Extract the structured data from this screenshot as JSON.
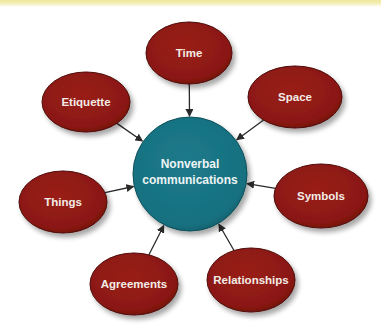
{
  "diagram": {
    "title": "Nonverbal communications",
    "center": {
      "line1": "Nonverbal",
      "line2": "communications",
      "color": "#1a7585",
      "cx": 190,
      "cy": 174,
      "r": 57
    },
    "node_color": "#8e1a14",
    "arrow_color": "#2a2a2a",
    "nodes": [
      {
        "label": "Time",
        "cx": 189,
        "cy": 53,
        "rx": 43,
        "ry": 31
      },
      {
        "label": "Space",
        "cx": 295,
        "cy": 97,
        "rx": 47,
        "ry": 31
      },
      {
        "label": "Etiquette",
        "cx": 86,
        "cy": 102,
        "rx": 44,
        "ry": 30
      },
      {
        "label": "Things",
        "cx": 63,
        "cy": 202,
        "rx": 44,
        "ry": 31
      },
      {
        "label": "Symbols",
        "cx": 321,
        "cy": 196,
        "rx": 47,
        "ry": 32
      },
      {
        "label": "Agreements",
        "cx": 134,
        "cy": 284,
        "rx": 44,
        "ry": 31
      },
      {
        "label": "Relationships",
        "cx": 251,
        "cy": 280,
        "rx": 44,
        "ry": 32
      }
    ],
    "edges": [
      {
        "from": "Time",
        "to": "Nonverbal communications"
      },
      {
        "from": "Space",
        "to": "Nonverbal communications"
      },
      {
        "from": "Etiquette",
        "to": "Nonverbal communications"
      },
      {
        "from": "Things",
        "to": "Nonverbal communications"
      },
      {
        "from": "Symbols",
        "to": "Nonverbal communications"
      },
      {
        "from": "Agreements",
        "to": "Nonverbal communications"
      },
      {
        "from": "Relationships",
        "to": "Nonverbal communications"
      }
    ]
  }
}
